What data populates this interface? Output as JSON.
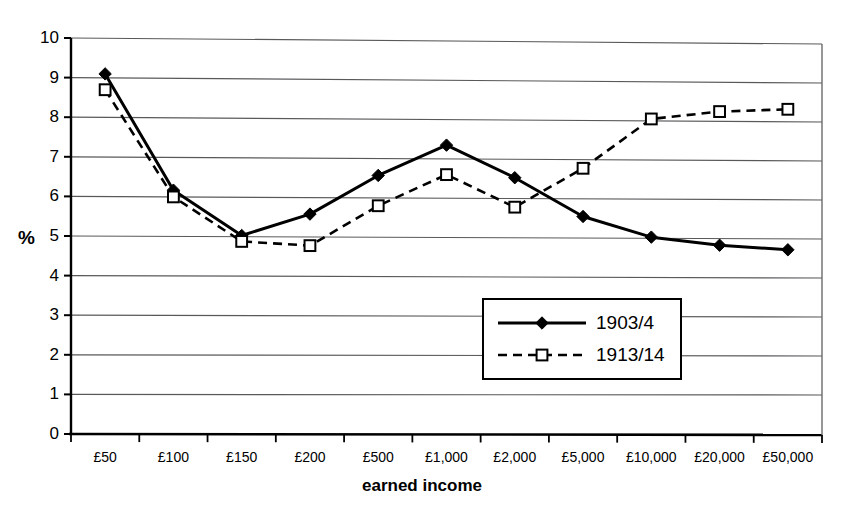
{
  "scan_artifacts": {
    "left_fragment": "",
    "right_fragment": ""
  },
  "chart_data": {
    "type": "line",
    "title": "",
    "xlabel": "earned income",
    "ylabel": "%",
    "categories": [
      "£50",
      "£100",
      "£150",
      "£200",
      "£500",
      "£1,000",
      "£2,000",
      "£5,000",
      "£10,000",
      "£20,000",
      "£50,000"
    ],
    "ylim": [
      0,
      10
    ],
    "yticks": [
      0,
      1,
      2,
      3,
      4,
      5,
      6,
      7,
      8,
      9,
      10
    ],
    "ytick_labels": [
      "0",
      "1",
      "2",
      "3",
      "4",
      "5",
      "6",
      "7",
      "8",
      "9",
      "10"
    ],
    "grid": "horizontal",
    "legend_position": "center-right-inside",
    "series": [
      {
        "name": "1903/4",
        "marker": "filled-diamond",
        "line_style": "solid",
        "color": "#000000",
        "values": [
          9.1,
          6.17,
          5.03,
          5.58,
          6.57,
          7.35,
          6.53,
          5.55,
          5.03,
          4.83,
          4.72
        ]
      },
      {
        "name": "1913/14",
        "marker": "open-square",
        "line_style": "dashed",
        "color": "#000000",
        "values": [
          8.7,
          6.0,
          4.88,
          4.78,
          5.8,
          6.6,
          5.78,
          6.78,
          8.05,
          8.25,
          8.32
        ]
      }
    ]
  }
}
